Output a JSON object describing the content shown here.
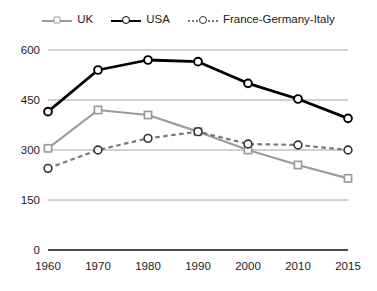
{
  "legend": {
    "position": "top-center",
    "items": [
      {
        "label": "UK",
        "icon": "line-square-marker-icon",
        "color": "#9b9b9b",
        "style": "solid"
      },
      {
        "label": "USA",
        "icon": "line-circle-marker-icon",
        "color": "#000000",
        "style": "solid"
      },
      {
        "label": "France-Germany-Italy",
        "icon": "line-circle-marker-icon",
        "color": "#777777",
        "style": "dotted"
      }
    ]
  },
  "axes": {
    "y_ticks": [
      "0",
      "150",
      "300",
      "450",
      "600"
    ],
    "x_ticks": [
      "1960",
      "1970",
      "1980",
      "1990",
      "2000",
      "2010",
      "2015"
    ]
  },
  "chart_data": {
    "type": "line",
    "title": "",
    "subtitle": "",
    "xlabel": "",
    "ylabel": "",
    "categories": [
      "1960",
      "1970",
      "1980",
      "1990",
      "2000",
      "2010",
      "2015"
    ],
    "series": [
      {
        "name": "UK",
        "color": "#9b9b9b",
        "marker": "square",
        "dash": "solid",
        "values": [
          305,
          420,
          405,
          355,
          300,
          255,
          215
        ]
      },
      {
        "name": "USA",
        "color": "#000000",
        "marker": "circle",
        "dash": "solid",
        "values": [
          415,
          540,
          570,
          565,
          500,
          453,
          395
        ]
      },
      {
        "name": "France-Germany-Italy",
        "color": "#777777",
        "marker": "circle",
        "dash": "dotted",
        "values": [
          245,
          300,
          335,
          355,
          318,
          315,
          300
        ]
      }
    ],
    "ylim": [
      0,
      600
    ],
    "ytick_step": 150,
    "grid": "horizontal",
    "legend_position": "top"
  }
}
